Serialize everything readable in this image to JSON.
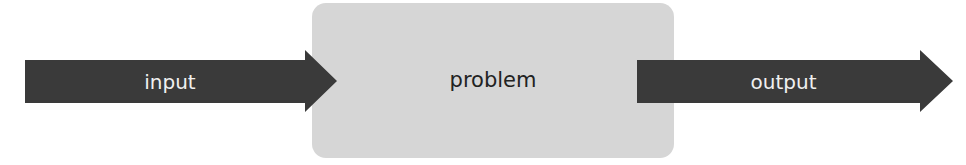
{
  "diagram": {
    "nodes": [
      {
        "id": "input",
        "label": "input",
        "shape": "arrow"
      },
      {
        "id": "problem",
        "label": "problem",
        "shape": "rounded-rectangle"
      },
      {
        "id": "output",
        "label": "output",
        "shape": "arrow"
      }
    ],
    "edges": [
      {
        "from": "input",
        "to": "problem"
      },
      {
        "from": "problem",
        "to": "output"
      }
    ],
    "colors": {
      "arrow_fill": "#3a3a3a",
      "box_fill": "#d6d6d6",
      "arrow_text": "#f0f0f0",
      "box_text": "#222222"
    }
  }
}
